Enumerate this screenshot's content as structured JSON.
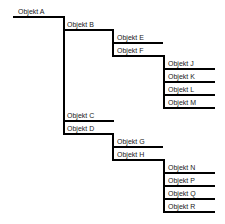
{
  "diagram": {
    "type": "tree",
    "color": "#000000",
    "nodes": [
      {
        "id": "A",
        "label": "Objekt A",
        "parent": null
      },
      {
        "id": "B",
        "label": "Objekt B",
        "parent": "A"
      },
      {
        "id": "E",
        "label": "Objekt E",
        "parent": "B"
      },
      {
        "id": "F",
        "label": "Objekt F",
        "parent": "B"
      },
      {
        "id": "J",
        "label": "Objekt J",
        "parent": "F"
      },
      {
        "id": "K",
        "label": "Objekt K",
        "parent": "F"
      },
      {
        "id": "L",
        "label": "Objekt L",
        "parent": "F"
      },
      {
        "id": "M",
        "label": "Objekt M",
        "parent": "F"
      },
      {
        "id": "C",
        "label": "Objekt C",
        "parent": "A"
      },
      {
        "id": "D",
        "label": "Objekt D",
        "parent": "A"
      },
      {
        "id": "G",
        "label": "Objekt G",
        "parent": "D"
      },
      {
        "id": "H",
        "label": "Objekt H",
        "parent": "D"
      },
      {
        "id": "N",
        "label": "Objekt N",
        "parent": "H"
      },
      {
        "id": "P",
        "label": "Objekt P",
        "parent": "H"
      },
      {
        "id": "Q",
        "label": "Objekt Q",
        "parent": "H"
      },
      {
        "id": "R",
        "label": "Objekt R",
        "parent": "H"
      }
    ]
  },
  "labels": {
    "A": "Objekt A",
    "B": "Objekt B",
    "C": "Objekt C",
    "D": "Objekt D",
    "E": "Objekt E",
    "F": "Objekt F",
    "G": "Objekt G",
    "H": "Objekt H",
    "J": "Objekt J",
    "K": "Objekt K",
    "L": "Objekt L",
    "M": "Objekt M",
    "N": "Objekt N",
    "P": "Objekt P",
    "Q": "Objekt Q",
    "R": "Objekt R"
  }
}
